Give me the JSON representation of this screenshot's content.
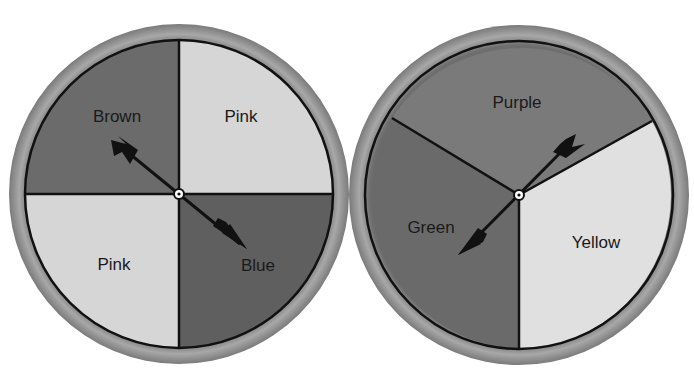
{
  "spinners": [
    {
      "name": "spinner-a",
      "sections": [
        {
          "label": "Brown",
          "shade": "#6b6b6b"
        },
        {
          "label": "Pink",
          "shade": "#d6d6d6"
        },
        {
          "label": "Blue",
          "shade": "#5f5f5f"
        },
        {
          "label": "Pink",
          "shade": "#d6d6d6"
        }
      ]
    },
    {
      "name": "spinner-b",
      "sections": [
        {
          "label": "Purple",
          "shade": "#7a7a7a"
        },
        {
          "label": "Yellow",
          "shade": "#e0e0e0"
        },
        {
          "label": "Green",
          "shade": "#6a6a6a"
        }
      ]
    }
  ],
  "colors": {
    "rim": "#8c8c8c",
    "outline": "#111111",
    "arrow": "#111111",
    "background": "#ffffff"
  }
}
